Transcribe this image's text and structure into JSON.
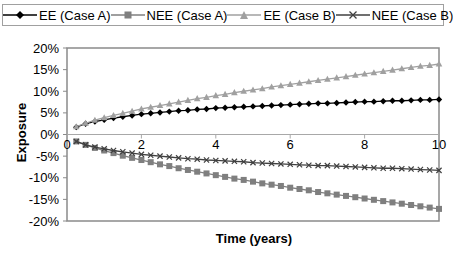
{
  "chart_data": {
    "type": "line",
    "title": "",
    "xlabel": "Time (years)",
    "ylabel": "Exposure",
    "xlim": [
      0,
      10
    ],
    "ylim": [
      -20,
      20
    ],
    "xticks": [
      "0",
      "2",
      "4",
      "6",
      "8",
      "10"
    ],
    "yticks": [
      "20%",
      "15%",
      "10%",
      "5%",
      "0%",
      "-5%",
      "-10%",
      "-15%",
      "-20%"
    ],
    "grid": false,
    "legend_position": "top",
    "x": [
      0.25,
      0.5,
      0.75,
      1,
      1.25,
      1.5,
      1.75,
      2,
      2.25,
      2.5,
      2.75,
      3,
      3.25,
      3.5,
      3.75,
      4,
      4.25,
      4.5,
      4.75,
      5,
      5.25,
      5.5,
      5.75,
      6,
      6.25,
      6.5,
      6.75,
      7,
      7.25,
      7.5,
      7.75,
      8,
      8.25,
      8.5,
      8.75,
      9,
      9.25,
      9.5,
      9.75,
      10
    ],
    "series": [
      {
        "name": "EE (Case A)",
        "color": "#000000",
        "marker": "diamond",
        "values": [
          1.7,
          2.5,
          3.0,
          3.4,
          3.8,
          4.1,
          4.4,
          4.7,
          4.9,
          5.1,
          5.3,
          5.5,
          5.6,
          5.8,
          5.9,
          6.1,
          6.2,
          6.3,
          6.4,
          6.5,
          6.6,
          6.7,
          6.8,
          6.9,
          7.0,
          7.1,
          7.2,
          7.2,
          7.3,
          7.4,
          7.5,
          7.6,
          7.6,
          7.7,
          7.8,
          7.8,
          7.9,
          8.0,
          8.0,
          8.1
        ]
      },
      {
        "name": "NEE (Case A)",
        "color": "#7f7f7f",
        "marker": "square",
        "values": [
          -1.6,
          -2.4,
          -3.1,
          -3.7,
          -4.3,
          -4.9,
          -5.4,
          -5.9,
          -6.4,
          -6.9,
          -7.3,
          -7.8,
          -8.2,
          -8.6,
          -9.0,
          -9.4,
          -9.8,
          -10.2,
          -10.5,
          -10.9,
          -11.3,
          -11.6,
          -11.9,
          -12.3,
          -12.6,
          -12.9,
          -13.3,
          -13.6,
          -13.9,
          -14.2,
          -14.5,
          -14.8,
          -15.1,
          -15.4,
          -15.7,
          -16.0,
          -16.3,
          -16.6,
          -16.9,
          -17.2
        ]
      },
      {
        "name": "EE (Case B)",
        "color": "#a0a0a0",
        "marker": "triangle",
        "values": [
          1.8,
          2.6,
          3.3,
          3.9,
          4.4,
          4.9,
          5.4,
          5.9,
          6.3,
          6.7,
          7.1,
          7.5,
          7.9,
          8.3,
          8.6,
          9.0,
          9.3,
          9.7,
          10.0,
          10.3,
          10.6,
          11.0,
          11.3,
          11.6,
          11.9,
          12.2,
          12.5,
          12.8,
          13.1,
          13.4,
          13.7,
          14.0,
          14.3,
          14.6,
          14.9,
          15.2,
          15.5,
          15.8,
          16.0,
          16.3
        ]
      },
      {
        "name": "NEE (Case B)",
        "color": "#404040",
        "marker": "x",
        "values": [
          -1.6,
          -2.4,
          -2.9,
          -3.3,
          -3.7,
          -4.0,
          -4.3,
          -4.6,
          -4.8,
          -5.0,
          -5.2,
          -5.4,
          -5.6,
          -5.7,
          -5.9,
          -6.0,
          -6.1,
          -6.2,
          -6.3,
          -6.5,
          -6.6,
          -6.7,
          -6.8,
          -6.9,
          -7.0,
          -7.1,
          -7.2,
          -7.2,
          -7.3,
          -7.4,
          -7.5,
          -7.6,
          -7.7,
          -7.8,
          -7.8,
          -7.9,
          -8.0,
          -8.1,
          -8.2,
          -8.3
        ]
      }
    ]
  },
  "legend": {
    "items": [
      {
        "label": "EE (Case A)"
      },
      {
        "label": "NEE (Case A)"
      },
      {
        "label": "EE (Case B)"
      },
      {
        "label": "NEE (Case B)"
      }
    ]
  },
  "axes": {
    "xlabel": "Time (years)",
    "ylabel": "Exposure"
  }
}
